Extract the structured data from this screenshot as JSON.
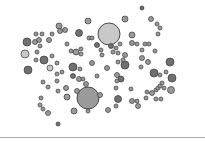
{
  "caption": "",
  "chart_data": {
    "type": "scatter",
    "subtype": "bubble",
    "title": "",
    "xlabel": "",
    "ylabel": "",
    "grid": false,
    "legend": null,
    "stroke_color": "#3a3a3a",
    "fills": {
      "light": "#c8c8c8",
      "mid": "#9a9a9a",
      "dark": "#707070"
    },
    "points": [
      {
        "x": 109,
        "y": 34,
        "r": 11,
        "fill": "light"
      },
      {
        "x": 88,
        "y": 98,
        "r": 11,
        "fill": "mid"
      },
      {
        "x": 25,
        "y": 54,
        "r": 4,
        "fill": "light"
      },
      {
        "x": 27,
        "y": 42,
        "r": 4,
        "fill": "dark"
      },
      {
        "x": 28,
        "y": 70,
        "r": 4,
        "fill": "dark"
      },
      {
        "x": 44,
        "y": 60,
        "r": 4,
        "fill": "dark"
      },
      {
        "x": 79,
        "y": 33,
        "r": 3.5,
        "fill": "dark"
      },
      {
        "x": 125,
        "y": 65,
        "r": 4,
        "fill": "dark"
      },
      {
        "x": 170,
        "y": 62,
        "r": 4,
        "fill": "dark"
      },
      {
        "x": 172,
        "y": 78,
        "r": 4,
        "fill": "dark"
      },
      {
        "x": 171,
        "y": 90,
        "r": 3.5,
        "fill": "mid"
      },
      {
        "x": 154,
        "y": 73,
        "r": 4,
        "fill": "dark"
      },
      {
        "x": 118,
        "y": 99,
        "r": 3.5,
        "fill": "dark"
      },
      {
        "x": 73,
        "y": 67,
        "r": 4,
        "fill": "dark"
      },
      {
        "x": 74,
        "y": 111,
        "r": 3,
        "fill": "mid"
      },
      {
        "x": 59,
        "y": 26,
        "r": 3,
        "fill": "mid"
      },
      {
        "x": 88,
        "y": 21,
        "r": 3,
        "fill": "mid"
      },
      {
        "x": 125,
        "y": 19,
        "r": 3,
        "fill": "mid"
      },
      {
        "x": 132,
        "y": 35,
        "r": 3,
        "fill": "mid"
      },
      {
        "x": 142,
        "y": 8,
        "r": 2,
        "fill": "dark"
      },
      {
        "x": 151,
        "y": 19,
        "r": 2.5,
        "fill": "mid"
      },
      {
        "x": 157,
        "y": 24,
        "r": 2,
        "fill": "mid"
      },
      {
        "x": 158,
        "y": 34,
        "r": 2,
        "fill": "mid"
      },
      {
        "x": 160,
        "y": 28,
        "r": 2,
        "fill": "mid"
      },
      {
        "x": 36,
        "y": 34,
        "r": 2,
        "fill": "mid"
      },
      {
        "x": 42,
        "y": 34,
        "r": 2,
        "fill": "mid"
      },
      {
        "x": 52,
        "y": 34,
        "r": 2,
        "fill": "mid"
      },
      {
        "x": 60,
        "y": 31,
        "r": 2.5,
        "fill": "mid"
      },
      {
        "x": 65,
        "y": 30,
        "r": 2.5,
        "fill": "mid"
      },
      {
        "x": 35,
        "y": 42,
        "r": 2.5,
        "fill": "mid"
      },
      {
        "x": 39,
        "y": 40,
        "r": 2.5,
        "fill": "mid"
      },
      {
        "x": 40,
        "y": 46,
        "r": 2,
        "fill": "mid"
      },
      {
        "x": 49,
        "y": 40,
        "r": 2.5,
        "fill": "mid"
      },
      {
        "x": 37,
        "y": 52,
        "r": 2,
        "fill": "mid"
      },
      {
        "x": 36,
        "y": 60,
        "r": 2,
        "fill": "mid"
      },
      {
        "x": 50,
        "y": 68,
        "r": 3,
        "fill": "light"
      },
      {
        "x": 57,
        "y": 63,
        "r": 2,
        "fill": "mid"
      },
      {
        "x": 43,
        "y": 82,
        "r": 2,
        "fill": "mid"
      },
      {
        "x": 48,
        "y": 87,
        "r": 2,
        "fill": "mid"
      },
      {
        "x": 57,
        "y": 81,
        "r": 2,
        "fill": "mid"
      },
      {
        "x": 58,
        "y": 91,
        "r": 2,
        "fill": "mid"
      },
      {
        "x": 41,
        "y": 98,
        "r": 2,
        "fill": "mid"
      },
      {
        "x": 40,
        "y": 105,
        "r": 2,
        "fill": "mid"
      },
      {
        "x": 43,
        "y": 109,
        "r": 2,
        "fill": "mid"
      },
      {
        "x": 48,
        "y": 113,
        "r": 2.5,
        "fill": "mid"
      },
      {
        "x": 58,
        "y": 124,
        "r": 2,
        "fill": "dark"
      },
      {
        "x": 67,
        "y": 44,
        "r": 2,
        "fill": "mid"
      },
      {
        "x": 76,
        "y": 52,
        "r": 3,
        "fill": "mid"
      },
      {
        "x": 81,
        "y": 49,
        "r": 2,
        "fill": "mid"
      },
      {
        "x": 81,
        "y": 54,
        "r": 2,
        "fill": "mid"
      },
      {
        "x": 80,
        "y": 69,
        "r": 2,
        "fill": "mid"
      },
      {
        "x": 73,
        "y": 76,
        "r": 2.5,
        "fill": "dark"
      },
      {
        "x": 79,
        "y": 79,
        "r": 2.5,
        "fill": "mid"
      },
      {
        "x": 83,
        "y": 79,
        "r": 2,
        "fill": "mid"
      },
      {
        "x": 66,
        "y": 88,
        "r": 2.5,
        "fill": "mid"
      },
      {
        "x": 67,
        "y": 97,
        "r": 3,
        "fill": "mid"
      },
      {
        "x": 77,
        "y": 91,
        "r": 2.5,
        "fill": "mid"
      },
      {
        "x": 86,
        "y": 84,
        "r": 2.5,
        "fill": "mid"
      },
      {
        "x": 92,
        "y": 63,
        "r": 2.5,
        "fill": "mid"
      },
      {
        "x": 97,
        "y": 76,
        "r": 2,
        "fill": "mid"
      },
      {
        "x": 100,
        "y": 95,
        "r": 2.5,
        "fill": "mid"
      },
      {
        "x": 88,
        "y": 111,
        "r": 2,
        "fill": "mid"
      },
      {
        "x": 108,
        "y": 110,
        "r": 2.5,
        "fill": "mid"
      },
      {
        "x": 102,
        "y": 55,
        "r": 2,
        "fill": "mid"
      },
      {
        "x": 107,
        "y": 68,
        "r": 2.5,
        "fill": "mid"
      },
      {
        "x": 111,
        "y": 46,
        "r": 2.5,
        "fill": "dark"
      },
      {
        "x": 113,
        "y": 52,
        "r": 2,
        "fill": "mid"
      },
      {
        "x": 116,
        "y": 48,
        "r": 2,
        "fill": "mid"
      },
      {
        "x": 118,
        "y": 53,
        "r": 2,
        "fill": "mid"
      },
      {
        "x": 120,
        "y": 44,
        "r": 2,
        "fill": "mid"
      },
      {
        "x": 125,
        "y": 55,
        "r": 2.5,
        "fill": "mid"
      },
      {
        "x": 123,
        "y": 60,
        "r": 2,
        "fill": "mid"
      },
      {
        "x": 118,
        "y": 62,
        "r": 2,
        "fill": "mid"
      },
      {
        "x": 117,
        "y": 75,
        "r": 2.5,
        "fill": "mid"
      },
      {
        "x": 121,
        "y": 79,
        "r": 3,
        "fill": "dark"
      },
      {
        "x": 117,
        "y": 81,
        "r": 2,
        "fill": "mid"
      },
      {
        "x": 116,
        "y": 88,
        "r": 2,
        "fill": "mid"
      },
      {
        "x": 116,
        "y": 106,
        "r": 2,
        "fill": "mid"
      },
      {
        "x": 131,
        "y": 89,
        "r": 2,
        "fill": "mid"
      },
      {
        "x": 132,
        "y": 101,
        "r": 2.5,
        "fill": "mid"
      },
      {
        "x": 137,
        "y": 101,
        "r": 2,
        "fill": "mid"
      },
      {
        "x": 138,
        "y": 106,
        "r": 2.5,
        "fill": "mid"
      },
      {
        "x": 132,
        "y": 43,
        "r": 2.5,
        "fill": "mid"
      },
      {
        "x": 137,
        "y": 44,
        "r": 2,
        "fill": "mid"
      },
      {
        "x": 142,
        "y": 50,
        "r": 2,
        "fill": "mid"
      },
      {
        "x": 145,
        "y": 44,
        "r": 2,
        "fill": "mid"
      },
      {
        "x": 149,
        "y": 44,
        "r": 2,
        "fill": "mid"
      },
      {
        "x": 142,
        "y": 58,
        "r": 2.5,
        "fill": "mid"
      },
      {
        "x": 148,
        "y": 62,
        "r": 2.5,
        "fill": "mid"
      },
      {
        "x": 155,
        "y": 51,
        "r": 2,
        "fill": "mid"
      },
      {
        "x": 141,
        "y": 67,
        "r": 2,
        "fill": "mid"
      },
      {
        "x": 147,
        "y": 92,
        "r": 2,
        "fill": "mid"
      },
      {
        "x": 152,
        "y": 93,
        "r": 2.5,
        "fill": "mid"
      },
      {
        "x": 156,
        "y": 90,
        "r": 2,
        "fill": "mid"
      },
      {
        "x": 158,
        "y": 88,
        "r": 2,
        "fill": "mid"
      },
      {
        "x": 160,
        "y": 86,
        "r": 2,
        "fill": "mid"
      },
      {
        "x": 164,
        "y": 88,
        "r": 2,
        "fill": "mid"
      },
      {
        "x": 162,
        "y": 83,
        "r": 2,
        "fill": "mid"
      },
      {
        "x": 146,
        "y": 98,
        "r": 2,
        "fill": "mid"
      },
      {
        "x": 156,
        "y": 99,
        "r": 2,
        "fill": "mid"
      },
      {
        "x": 161,
        "y": 99,
        "r": 2,
        "fill": "mid"
      },
      {
        "x": 166,
        "y": 72,
        "r": 2,
        "fill": "mid"
      },
      {
        "x": 160,
        "y": 75,
        "r": 2,
        "fill": "mid"
      },
      {
        "x": 52,
        "y": 56,
        "r": 2,
        "fill": "mid"
      },
      {
        "x": 57,
        "y": 74,
        "r": 2,
        "fill": "mid"
      },
      {
        "x": 97,
        "y": 45,
        "r": 2.5,
        "fill": "dark"
      },
      {
        "x": 101,
        "y": 50,
        "r": 2,
        "fill": "mid"
      },
      {
        "x": 89,
        "y": 38,
        "r": 2,
        "fill": "mid"
      },
      {
        "x": 92,
        "y": 38,
        "r": 2,
        "fill": "mid"
      },
      {
        "x": 71,
        "y": 51,
        "r": 2,
        "fill": "mid"
      },
      {
        "x": 62,
        "y": 72,
        "r": 2,
        "fill": "mid"
      }
    ]
  }
}
